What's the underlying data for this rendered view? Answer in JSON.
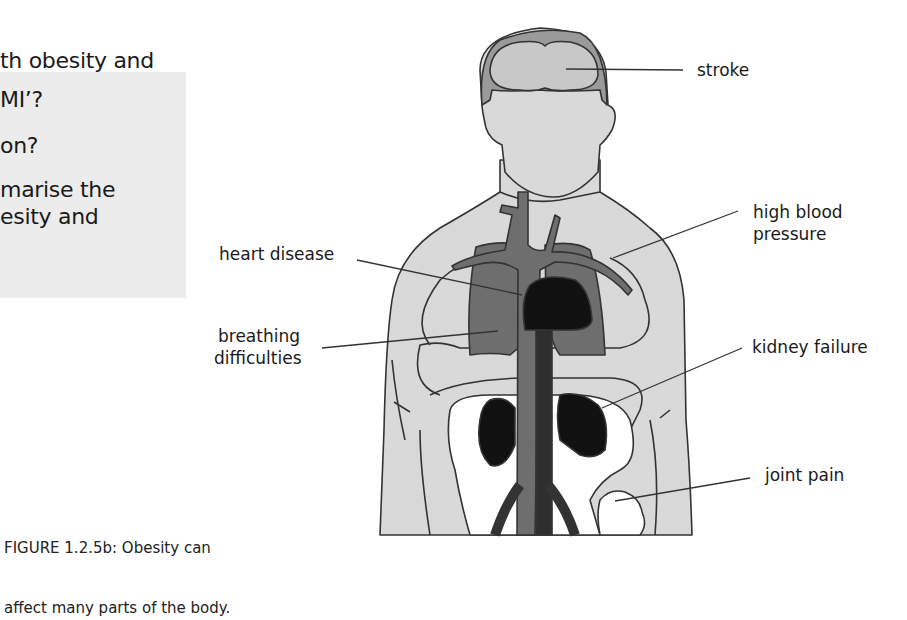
{
  "intro_text": {
    "lines": [
      "th obesity and",
      "h."
    ]
  },
  "question_box": {
    "lines": [
      "MI’?",
      "on?",
      "marise the",
      "esity and"
    ]
  },
  "figure": {
    "caption_lines": [
      "FIGURE 1.2.5b: Obesity can",
      "affect many parts of the body."
    ],
    "labels": {
      "stroke": "stroke",
      "high_blood_pressure": [
        "high blood",
        "pressure"
      ],
      "heart_disease": "heart disease",
      "breathing_difficulties": [
        "breathing",
        "difficulties"
      ],
      "kidney_failure": "kidney failure",
      "joint_pain": "joint pain"
    },
    "colors": {
      "skin": "#d9d9d9",
      "hair": "#9a9a9a",
      "brain": "#c8c8c8",
      "organs_mid": "#6e6e6e",
      "organs_dark": "#111111",
      "outline": "#333333",
      "bone": "#ffffff",
      "question_box": "#ececec"
    }
  }
}
